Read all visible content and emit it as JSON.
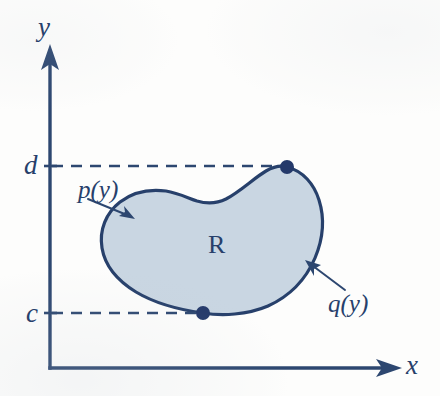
{
  "figure": {
    "caption_region_label": "R",
    "colors": {
      "stroke": "#27406b",
      "axis": "#2d4770",
      "region_fill": "#c9d6e2",
      "marker": "#24396a",
      "background": "#fdfdfc"
    }
  },
  "axes": {
    "x_axis_label": "x",
    "y_axis_label": "y",
    "x_axis_name": "horizontal-axis",
    "y_axis_name": "vertical-axis"
  },
  "ticks": [
    {
      "label": "d",
      "axis": "y",
      "name": "y-tick-d"
    },
    {
      "label": "c",
      "axis": "y",
      "name": "y-tick-c"
    }
  ],
  "curve_labels": [
    {
      "label": "p(y)",
      "name": "left-boundary-label"
    },
    {
      "label": "q(y)",
      "name": "right-boundary-label"
    }
  ],
  "region": {
    "label": "R",
    "fill": "#c9d6e2"
  },
  "markers": [
    {
      "name": "top-tangent-point",
      "at_tick": "d"
    },
    {
      "name": "bottom-tangent-point",
      "at_tick": "c"
    }
  ],
  "guides": [
    {
      "name": "dashed-guide-d",
      "from_tick": "d"
    },
    {
      "name": "dashed-guide-c",
      "from_tick": "c"
    }
  ]
}
